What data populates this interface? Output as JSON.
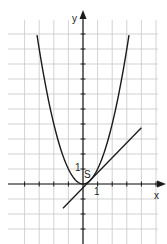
{
  "diagram": {
    "type": "function-graph",
    "axes": {
      "x_label": "x",
      "y_label": "y",
      "x_tick_label": "1",
      "y_tick_label": "1",
      "x_range": [
        -4,
        5
      ],
      "y_range": [
        -3,
        11
      ]
    },
    "point": {
      "label": "S",
      "x": 0.5,
      "y": 0.25
    },
    "curves": [
      {
        "name": "parabola",
        "equation": "y = x^2",
        "x_from": -3.15,
        "x_to": 3.15
      },
      {
        "name": "tangent-line",
        "equation": "y = x - 0.25",
        "x_from": -1.37,
        "x_to": 4.0
      }
    ],
    "colors": {
      "grid": "#c8c8c8",
      "axis": "#1a1a1a",
      "curve": "#1a1a1a",
      "background": "#ffffff"
    }
  }
}
